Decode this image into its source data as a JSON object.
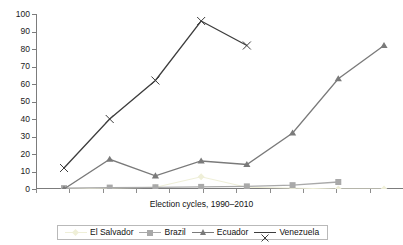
{
  "chart_data": {
    "type": "line",
    "title": "",
    "subtitle": "",
    "xlabel": "Election cycles, 1990–2010",
    "ylabel": "",
    "ylim": [
      0,
      100
    ],
    "ytick_labels": [
      "0",
      "10",
      "20",
      "30",
      "40",
      "50",
      "60",
      "70",
      "80",
      "90",
      "100"
    ],
    "ytick_values": [
      0,
      10,
      20,
      30,
      40,
      50,
      60,
      70,
      80,
      90,
      100
    ],
    "xtick_count": 11,
    "xtick_labels": [
      "",
      "",
      "",
      "",
      "",
      "",
      "",
      "",
      "",
      "",
      ""
    ],
    "grid": false,
    "legend_position": "bottom",
    "x": [
      1,
      2,
      3,
      4,
      5,
      6,
      7,
      8
    ],
    "series": [
      {
        "name": "El Salvador",
        "color": "#efefd8",
        "marker": "diamond",
        "values": [
          0,
          0.5,
          1,
          7,
          1,
          0.5,
          0,
          0
        ]
      },
      {
        "name": "Brazil",
        "color": "#a9a9a9",
        "marker": "square",
        "values": [
          0.5,
          0.8,
          1,
          1.2,
          1.5,
          2.2,
          4,
          null
        ]
      },
      {
        "name": "Ecuador",
        "color": "#7a7a7a",
        "marker": "triangle",
        "values": [
          0,
          17,
          7.5,
          16,
          14,
          32,
          63,
          82
        ]
      },
      {
        "name": "Venezuela",
        "color": "#3d3d3d",
        "marker": "cross",
        "values": [
          12,
          40,
          62,
          96,
          82,
          null,
          null,
          null
        ]
      }
    ]
  },
  "legend": {
    "items": [
      {
        "label": "El Salvador"
      },
      {
        "label": "Brazil"
      },
      {
        "label": "Ecuador"
      },
      {
        "label": "Venezuela"
      }
    ]
  }
}
